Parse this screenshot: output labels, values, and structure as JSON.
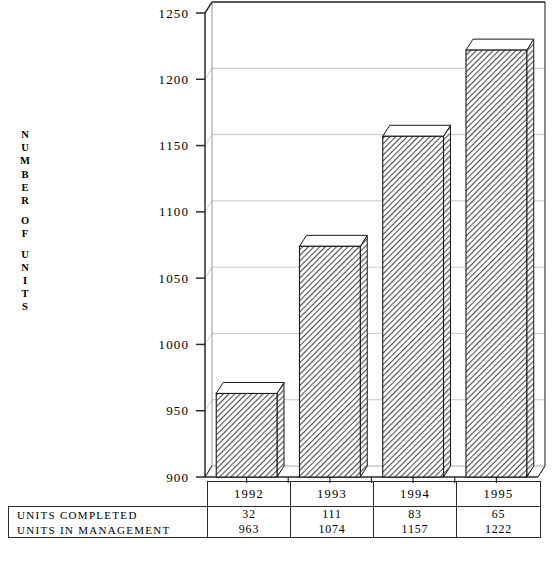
{
  "chart_data": {
    "type": "bar",
    "title": "",
    "subtitle": "",
    "xlabel": "",
    "ylabel": "NUMBER OF UNITS",
    "ylim": [
      900,
      1250
    ],
    "ytick_step": 50,
    "yticks": [
      "1250",
      "1200",
      "1150",
      "1100",
      "1050",
      "1000",
      "950",
      "900"
    ],
    "ytick_values": [
      1250,
      1200,
      1150,
      1100,
      1050,
      1000,
      950,
      900
    ],
    "categories": [
      "1992",
      "1993",
      "1994",
      "1995"
    ],
    "series": [
      {
        "name": "UNITS IN MANAGEMENT",
        "values": [
          963,
          1074,
          1157,
          1222
        ]
      }
    ],
    "grid": true,
    "gridlines_on": "y",
    "legend": false,
    "legend_position": "none",
    "three_d": true,
    "bar_fill": "diagonal-hatch",
    "annotations": []
  },
  "y_axis_title_letters": [
    "N",
    "U",
    "M",
    "B",
    "E",
    "R",
    "",
    "O",
    "F",
    "",
    "U",
    "N",
    "I",
    "T",
    "S"
  ],
  "table": {
    "corner_label": "",
    "column_headers": [
      "1992",
      "1993",
      "1994",
      "1995"
    ],
    "rows": [
      {
        "label": "UNITS COMPLETED",
        "values": [
          "32",
          "111",
          "83",
          "65"
        ]
      },
      {
        "label": "UNITS IN MANAGEMENT",
        "values": [
          "963",
          "1074",
          "1157",
          "1222"
        ]
      }
    ]
  },
  "colors": {
    "axis": "#2a2a2a",
    "grid": "#b8b8b8",
    "bar_outline": "#1a1a1a",
    "bar_face": "#a8a8a8",
    "bar_top": "#ffffff",
    "background": "#ffffff",
    "text": "#000000"
  }
}
